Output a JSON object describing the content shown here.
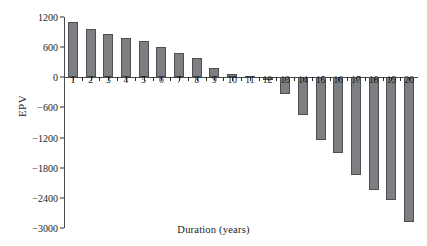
{
  "chart_data": {
    "type": "bar",
    "title": "",
    "xlabel": "Duration (years)",
    "ylabel": "EPV",
    "categories": [
      "1",
      "2",
      "3",
      "4",
      "5",
      "6",
      "7",
      "8",
      "9",
      "10",
      "11",
      "12",
      "13",
      "14",
      "15",
      "16",
      "17",
      "18",
      "19",
      "20"
    ],
    "values": [
      1100,
      960,
      860,
      790,
      720,
      600,
      480,
      380,
      190,
      60,
      20,
      -60,
      -340,
      -750,
      -1250,
      -1500,
      -1950,
      -2250,
      -2450,
      -2880
    ],
    "ylim": [
      -3000,
      1200
    ],
    "yticks": [
      1200,
      600,
      0,
      -600,
      -1200,
      -1800,
      -2400,
      -3000
    ],
    "ytick_labels": [
      "1200",
      "600",
      "0",
      "−600",
      "−1200",
      "−1800",
      "−2400",
      "−3000"
    ],
    "grid": false,
    "legend": null,
    "series": [
      {
        "name": "EPV",
        "values": [
          1100,
          960,
          860,
          790,
          720,
          600,
          480,
          380,
          190,
          60,
          20,
          -60,
          -340,
          -750,
          -1250,
          -1500,
          -1950,
          -2250,
          -2450,
          -2880
        ]
      }
    ],
    "colors": {
      "bar_fill": "#7e7f83",
      "bar_stroke": "#4d4e52",
      "axis": "#4a4a4a",
      "text": "#1a1a1a",
      "background": "#ffffff"
    }
  }
}
